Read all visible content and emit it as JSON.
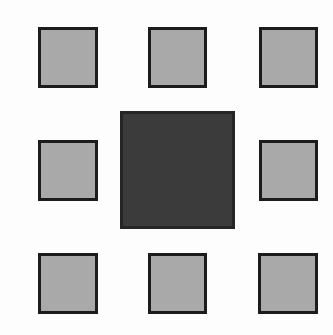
{
  "diagram": {
    "colors": {
      "background": "#fdfdfd",
      "outer_fill": "#a9a9a9",
      "outer_border": "#1c1c1c",
      "center_fill": "#3b3b3b",
      "center_border": "#262626"
    },
    "squares": [
      {
        "id": "top-left",
        "x": 38,
        "y": 27,
        "w": 60,
        "h": 61
      },
      {
        "id": "top-center",
        "x": 148,
        "y": 27,
        "w": 59,
        "h": 61
      },
      {
        "id": "top-right",
        "x": 259,
        "y": 27,
        "w": 59,
        "h": 61
      },
      {
        "id": "middle-left",
        "x": 38,
        "y": 140,
        "w": 60,
        "h": 61
      },
      {
        "id": "center",
        "x": 120,
        "y": 111,
        "w": 115,
        "h": 118
      },
      {
        "id": "middle-right",
        "x": 259,
        "y": 140,
        "w": 59,
        "h": 61
      },
      {
        "id": "bottom-left",
        "x": 38,
        "y": 253,
        "w": 60,
        "h": 61
      },
      {
        "id": "bottom-center",
        "x": 148,
        "y": 253,
        "w": 59,
        "h": 61
      },
      {
        "id": "bottom-right",
        "x": 258,
        "y": 253,
        "w": 60,
        "h": 61
      }
    ]
  }
}
